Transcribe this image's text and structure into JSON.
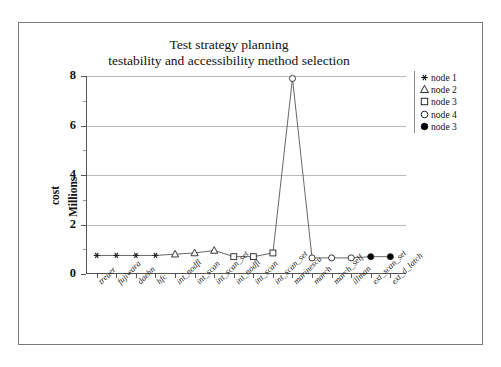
{
  "cut_caption": "cost estimates",
  "chart_data": {
    "type": "line",
    "title_line1": "Test strategy planning",
    "title_line2": "testability and accessibility method selection",
    "xlabel": "",
    "ylabel_line1": "cost",
    "ylabel_line2": "Millions",
    "grid": true,
    "legend_position": "right",
    "ylim": [
      0,
      8
    ],
    "yticks": [
      0,
      2,
      4,
      6,
      8
    ],
    "ytick_labels": [
      "0",
      "2",
      "4",
      "6",
      "8"
    ],
    "yminor_ticks": [
      1,
      3,
      5,
      7
    ],
    "categories": [
      "treuer",
      "fujiwara",
      "daehn",
      "hfc",
      "int_nodfl",
      "int_scan",
      "int_scan_set",
      "int_nodfl",
      "int_scan",
      "int_scan_set",
      "marinescu",
      "march",
      "march_self",
      "illman",
      "ext_scan_set",
      "ext_d_latch"
    ],
    "values": [
      0.75,
      0.75,
      0.75,
      0.75,
      0.8,
      0.85,
      0.95,
      0.7,
      0.7,
      0.85,
      7.9,
      0.65,
      0.65,
      0.65,
      0.7,
      0.7
    ],
    "marker_groups": [
      {
        "name": "node 1",
        "marker": "asterisk",
        "indices": [
          0,
          1,
          2,
          3
        ]
      },
      {
        "name": "node 2",
        "marker": "triangle-open",
        "indices": [
          4,
          5,
          6
        ]
      },
      {
        "name": "node 3",
        "marker": "square-open",
        "indices": [
          7,
          8,
          9
        ]
      },
      {
        "name": "node 4",
        "marker": "circle-open",
        "indices": [
          10,
          11,
          12,
          13
        ]
      },
      {
        "name": "node 3",
        "marker": "circle-filled",
        "indices": [
          14,
          15
        ]
      }
    ],
    "legend": [
      {
        "label": "node 1",
        "marker": "asterisk"
      },
      {
        "label": "node 2",
        "marker": "triangle-open"
      },
      {
        "label": "node 3",
        "marker": "square-open"
      },
      {
        "label": "node 4",
        "marker": "circle-open"
      },
      {
        "label": "node 3",
        "marker": "circle-filled"
      }
    ],
    "line_color": "#555555",
    "grid_color": "#b9b9b9",
    "axis_color": "#555555",
    "marker_color": "#222222"
  }
}
